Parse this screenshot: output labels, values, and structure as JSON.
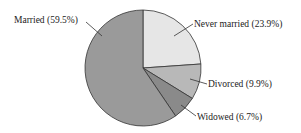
{
  "chart_data": {
    "type": "pie",
    "title": "",
    "categories": [
      "Married",
      "Never married",
      "Divorced",
      "Widowed"
    ],
    "values": [
      59.5,
      23.9,
      9.9,
      6.7
    ],
    "labels": [
      "Married (59.5%)",
      "Never married (23.9%)",
      "Divorced (9.9%)",
      "Widowed (6.7%)"
    ],
    "colors": [
      "#9a9a9a",
      "#e6e6e6",
      "#b8b8b8",
      "#8a8a8a"
    ],
    "start_angle_deg": 0,
    "direction": "clockwise",
    "legend": "none (callout labels)"
  }
}
